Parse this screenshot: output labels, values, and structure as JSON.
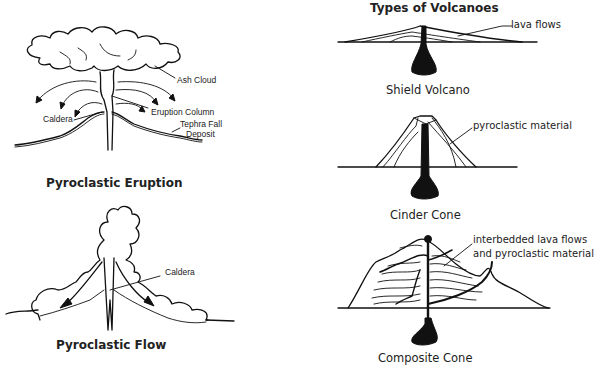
{
  "title": "Types of Volcanoes",
  "pyroclastic_eruption": {
    "caption": "Pyroclastic Eruption",
    "labels": {
      "ash_cloud": "Ash Cloud",
      "eruption_column": "Eruption Column",
      "caldera": "Caldera",
      "tephra_line1": "Tephra Fall",
      "tephra_line2": "Deposit"
    }
  },
  "pyroclastic_flow": {
    "caption": "Pyroclastic Flow",
    "labels": {
      "caldera": "Caldera"
    }
  },
  "shield_volcano": {
    "caption": "Shield Volcano",
    "labels": {
      "lava_flows": "lava flows"
    }
  },
  "cinder_cone": {
    "caption": "Cinder Cone",
    "labels": {
      "pyroclastic_material": "pyroclastic material"
    }
  },
  "composite_cone": {
    "caption": "Composite Cone",
    "labels": {
      "line1": "interbedded lava flows",
      "line2": "and pyroclastic material"
    }
  }
}
